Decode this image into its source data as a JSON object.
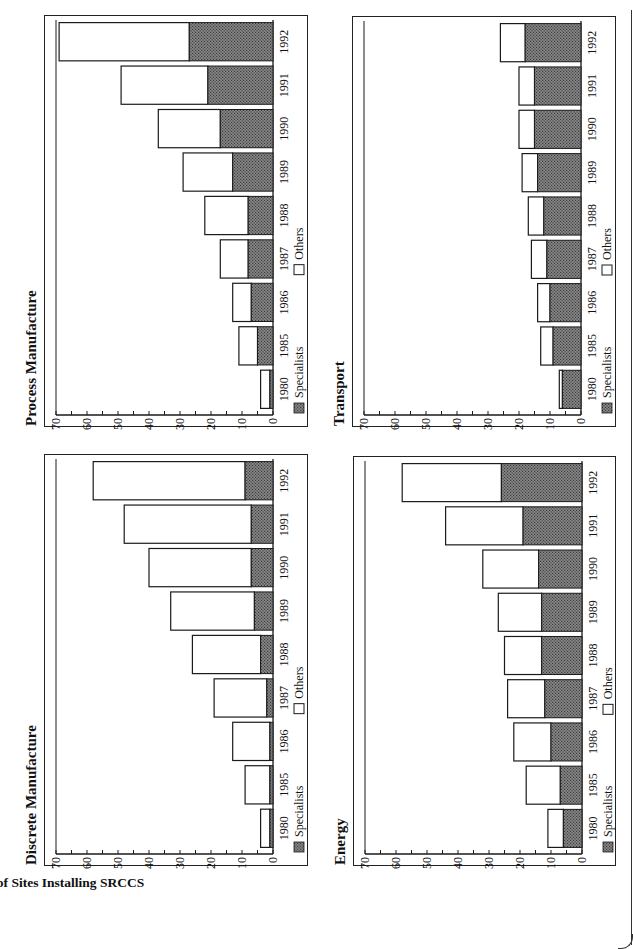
{
  "page": {
    "y_axis_label": "Number of Sites Installing SRCCS",
    "orientation": "rotated -90deg (landscape page scanned portrait)"
  },
  "legend": {
    "specialists_label": "Specialists",
    "others_label": "Others"
  },
  "colors": {
    "specialists_fill": "#8a8a8a",
    "specialists_pattern_dot": "#3a3a3a",
    "others_fill": "#ffffff",
    "stroke": "#1a1a1a"
  },
  "charts": [
    {
      "id": "discrete",
      "title": "Discrete Manufacture",
      "frame": {
        "x": 79,
        "y": 44,
        "w": 412,
        "h": 264
      }
    },
    {
      "id": "process",
      "title": "Process Manufacture",
      "frame": {
        "x": 518,
        "y": 44,
        "w": 412,
        "h": 264
      }
    },
    {
      "id": "energy",
      "title": "Energy",
      "frame": {
        "x": 79,
        "y": 353,
        "w": 410,
        "h": 263
      }
    },
    {
      "id": "transport",
      "title": "Transport",
      "frame": {
        "x": 518,
        "y": 352,
        "w": 411,
        "h": 264
      }
    }
  ],
  "chart_data": [
    {
      "type": "bar",
      "stacked": true,
      "title": "Discrete Manufacture",
      "xlabel": "",
      "ylabel": "Number of Sites Installing SRCCS",
      "ylim": [
        0,
        70
      ],
      "yticks": [
        0,
        10,
        20,
        30,
        40,
        50,
        60,
        70
      ],
      "categories": [
        "1980",
        "1985",
        "1986",
        "1987",
        "1988",
        "1989",
        "1990",
        "1991",
        "1992"
      ],
      "series": [
        {
          "name": "Specialists",
          "values": [
            1,
            1,
            1,
            2,
            4,
            6,
            7,
            7,
            9
          ]
        },
        {
          "name": "Others",
          "values": [
            3,
            8,
            12,
            17,
            22,
            27,
            33,
            41,
            49
          ]
        }
      ],
      "totals": [
        4,
        9,
        13,
        19,
        26,
        33,
        40,
        48,
        58
      ],
      "legend_position": "bottom",
      "grid": false
    },
    {
      "type": "bar",
      "stacked": true,
      "title": "Process Manufacture",
      "xlabel": "",
      "ylabel": "Number of Sites Installing SRCCS",
      "ylim": [
        0,
        70
      ],
      "yticks": [
        0,
        10,
        20,
        30,
        40,
        50,
        60,
        70
      ],
      "categories": [
        "1980",
        "1985",
        "1986",
        "1987",
        "1988",
        "1989",
        "1990",
        "1991",
        "1992"
      ],
      "series": [
        {
          "name": "Specialists",
          "values": [
            1,
            5,
            7,
            8,
            8,
            13,
            17,
            21,
            27
          ]
        },
        {
          "name": "Others",
          "values": [
            3,
            6,
            6,
            9,
            14,
            16,
            20,
            28,
            42
          ]
        }
      ],
      "totals": [
        4,
        11,
        13,
        17,
        22,
        29,
        37,
        49,
        69
      ],
      "legend_position": "bottom",
      "grid": false
    },
    {
      "type": "bar",
      "stacked": true,
      "title": "Energy",
      "xlabel": "",
      "ylabel": "Number of Sites Installing SRCCS",
      "ylim": [
        0,
        70
      ],
      "yticks": [
        0,
        10,
        20,
        30,
        40,
        50,
        60,
        70
      ],
      "categories": [
        "1980",
        "1985",
        "1986",
        "1987",
        "1988",
        "1989",
        "1990",
        "1991",
        "1992"
      ],
      "series": [
        {
          "name": "Specialists",
          "values": [
            6,
            7,
            10,
            12,
            13,
            13,
            14,
            19,
            26
          ]
        },
        {
          "name": "Others",
          "values": [
            5,
            11,
            12,
            12,
            12,
            14,
            18,
            25,
            32
          ]
        }
      ],
      "totals": [
        11,
        18,
        22,
        24,
        25,
        27,
        32,
        44,
        58
      ],
      "legend_position": "bottom",
      "grid": false
    },
    {
      "type": "bar",
      "stacked": true,
      "title": "Transport",
      "xlabel": "",
      "ylabel": "Number of Sites Installing SRCCS",
      "ylim": [
        0,
        70
      ],
      "yticks": [
        0,
        10,
        20,
        30,
        40,
        50,
        60,
        70
      ],
      "categories": [
        "1980",
        "1985",
        "1986",
        "1987",
        "1988",
        "1989",
        "1990",
        "1991",
        "1992"
      ],
      "series": [
        {
          "name": "Specialists",
          "values": [
            6,
            9,
            10,
            11,
            12,
            14,
            15,
            15,
            18
          ]
        },
        {
          "name": "Others",
          "values": [
            1,
            4,
            4,
            5,
            5,
            5,
            5,
            5,
            8
          ]
        }
      ],
      "totals": [
        7,
        13,
        14,
        16,
        17,
        19,
        20,
        20,
        26
      ],
      "legend_position": "bottom",
      "grid": false
    }
  ]
}
